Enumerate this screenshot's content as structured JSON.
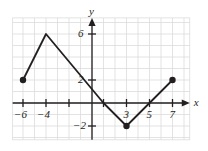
{
  "chart_data": {
    "type": "line",
    "title": "",
    "subtitle": "",
    "xlabel": "x",
    "ylabel": "y",
    "xlim": [
      -6.9,
      8.5
    ],
    "ylim": [
      -3.2,
      7.4
    ],
    "grid": true,
    "grid_step": 1,
    "legend": null,
    "x_ticks": [
      -6,
      -4,
      3,
      5,
      7
    ],
    "x_tick_labels": [
      "−6",
      "−4",
      "3",
      "5",
      "7"
    ],
    "y_ticks": [
      6,
      2,
      -2
    ],
    "y_tick_labels": [
      "6",
      "2",
      "−2"
    ],
    "minor_x_ticks": [
      -2,
      1
    ],
    "series": [
      {
        "name": "piecewise-linear-function",
        "x": [
          -6,
          -4,
          1,
          3,
          7
        ],
        "y": [
          2,
          6,
          0,
          -2,
          2
        ],
        "color": "#231f20",
        "endpoint_markers": "closed-circle",
        "vertex_markers": [
          "closed-circle",
          "none",
          "none",
          "closed-circle",
          "closed-circle"
        ]
      }
    ],
    "points": [
      {
        "label": "left endpoint",
        "x": -6,
        "y": 2,
        "marker": "filled"
      },
      {
        "label": "peak vertex",
        "x": -4,
        "y": 6,
        "marker": "none"
      },
      {
        "label": "x-intercept",
        "x": 1,
        "y": 0,
        "marker": "none"
      },
      {
        "label": "minimum vertex",
        "x": 3,
        "y": -2,
        "marker": "filled"
      },
      {
        "label": "right endpoint",
        "x": 7,
        "y": 2,
        "marker": "filled"
      }
    ],
    "colors": {
      "curve": "#231f20",
      "axis": "#231f20",
      "grid": "#dcdcdc",
      "marker": "#231f20",
      "background": "#ffffff"
    }
  },
  "axes": {
    "x_axis_label": "x",
    "y_axis_label": "y"
  },
  "labels": {
    "x_neg6": "−6",
    "x_neg4": "−4",
    "x_3": "3",
    "x_5": "5",
    "x_7": "7",
    "y_6": "6",
    "y_2": "2",
    "y_neg2": "−2"
  }
}
